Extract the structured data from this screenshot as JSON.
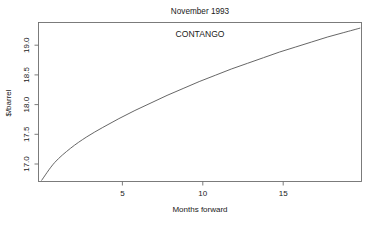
{
  "chart_data": {
    "type": "line",
    "title": "November 1993",
    "xlabel": "Months forward",
    "ylabel": "$/barrel",
    "annotation": "CONTANGO",
    "xlim": [
      0,
      20.1
    ],
    "ylim": [
      16.72,
      19.25
    ],
    "grid": false,
    "legend": null,
    "xticks": [
      5,
      10,
      15
    ],
    "xtick_labels": [
      "5",
      "10",
      "15"
    ],
    "yticks": [
      17.0,
      17.5,
      18.0,
      18.5,
      19.0
    ],
    "ytick_labels": [
      "17.0",
      "17.5",
      "18.0",
      "18.5",
      "19.0"
    ],
    "line_color": "#555555",
    "series": [
      {
        "name": "Forward curve",
        "x": [
          0.2,
          1,
          2,
          3,
          4,
          5,
          6,
          7,
          8,
          9,
          10,
          11,
          12,
          13,
          14,
          15,
          16,
          17,
          18,
          19,
          20
        ],
        "values": [
          16.74,
          17.02,
          17.25,
          17.43,
          17.58,
          17.72,
          17.85,
          17.97,
          18.09,
          18.2,
          18.31,
          18.41,
          18.51,
          18.6,
          18.69,
          18.78,
          18.86,
          18.94,
          19.02,
          19.09,
          19.16
        ]
      }
    ]
  },
  "figure": {
    "title_text": "November 1993",
    "annotation_text": "CONTANGO",
    "x_axis_title": "Months forward",
    "y_axis_title": "$/barrel",
    "x_tick_0": "5",
    "x_tick_1": "10",
    "x_tick_2": "15",
    "y_tick_0": "17.0",
    "y_tick_1": "17.5",
    "y_tick_2": "18.0",
    "y_tick_3": "18.5",
    "y_tick_4": "19.0"
  }
}
